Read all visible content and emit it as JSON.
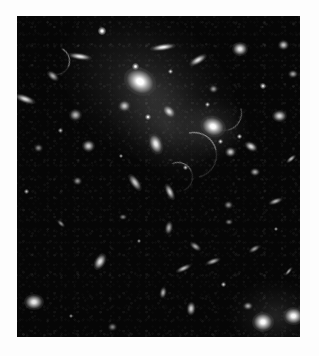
{
  "image": {
    "kind": "astronomical-photograph",
    "subject": "galaxy cluster",
    "description": "Grayscale deep-field image of a rich galaxy cluster with a dominant central cD galaxy, extended intracluster light, numerous elliptical and edge-on member galaxies, foreground stars and faint gravitationally lensed arcs.",
    "color_mode": "grayscale",
    "width_px": 319,
    "height_px": 356,
    "border_color": "#fdfdfd",
    "sky_background_color": "#060606",
    "plate": {
      "x": 17,
      "y": 16,
      "width": 283,
      "height": 321
    }
  },
  "chart_data": {
    "type": "scatter",
    "title": "",
    "xlabel": "",
    "ylabel": "",
    "xlim": [
      0,
      283
    ],
    "ylim": [
      0,
      321
    ],
    "grid": false,
    "legend": "none",
    "series": [
      {
        "name": "intracluster-light",
        "points": [
          {
            "x": 132,
            "y": 72,
            "size": 190,
            "brightness": 0.3,
            "angle": 35,
            "ratio": 0.72
          },
          {
            "x": 150,
            "y": 110,
            "size": 130,
            "brightness": 0.2,
            "angle": 40,
            "ratio": 0.68
          },
          {
            "x": 196,
            "y": 112,
            "size": 72,
            "brightness": 0.26,
            "angle": 10,
            "ratio": 0.85
          },
          {
            "x": 258,
            "y": 300,
            "size": 90,
            "brightness": 0.22,
            "angle": 0,
            "ratio": 0.8
          }
        ]
      },
      {
        "name": "bright-cluster-galaxies",
        "points": [
          {
            "x": 123,
            "y": 66,
            "size": 34,
            "brightness": 1.0,
            "angle": 30,
            "ratio": 0.8,
            "label": "cD-galaxy"
          },
          {
            "x": 196,
            "y": 111,
            "size": 26,
            "brightness": 0.97,
            "angle": 20,
            "ratio": 0.82,
            "label": "second-brightest"
          },
          {
            "x": 139,
            "y": 128,
            "size": 22,
            "brightness": 0.88,
            "angle": 70,
            "ratio": 0.62,
            "label": "elliptical-c"
          },
          {
            "x": 152,
            "y": 96,
            "size": 16,
            "brightness": 0.8,
            "angle": 45,
            "ratio": 0.7
          },
          {
            "x": 107,
            "y": 90,
            "size": 13,
            "brightness": 0.72,
            "angle": 0,
            "ratio": 0.9
          }
        ]
      },
      {
        "name": "member-galaxies",
        "points": [
          {
            "x": 63,
            "y": 41,
            "size": 24,
            "brightness": 0.85,
            "angle": 8,
            "ratio": 0.3
          },
          {
            "x": 146,
            "y": 31,
            "size": 26,
            "brightness": 0.9,
            "angle": 172,
            "ratio": 0.26
          },
          {
            "x": 181,
            "y": 44,
            "size": 20,
            "brightness": 0.82,
            "angle": 150,
            "ratio": 0.4
          },
          {
            "x": 223,
            "y": 33,
            "size": 16,
            "brightness": 0.86,
            "angle": 0,
            "ratio": 0.88
          },
          {
            "x": 266,
            "y": 29,
            "size": 11,
            "brightness": 0.7,
            "angle": 0,
            "ratio": 0.9
          },
          {
            "x": 36,
            "y": 60,
            "size": 14,
            "brightness": 0.62,
            "angle": 40,
            "ratio": 0.55
          },
          {
            "x": 8,
            "y": 83,
            "size": 22,
            "brightness": 0.8,
            "angle": 20,
            "ratio": 0.38
          },
          {
            "x": 58,
            "y": 99,
            "size": 13,
            "brightness": 0.66,
            "angle": 0,
            "ratio": 0.85
          },
          {
            "x": 71,
            "y": 130,
            "size": 13,
            "brightness": 0.74,
            "angle": 0,
            "ratio": 0.88
          },
          {
            "x": 262,
            "y": 100,
            "size": 15,
            "brightness": 0.78,
            "angle": 0,
            "ratio": 0.86
          },
          {
            "x": 234,
            "y": 131,
            "size": 14,
            "brightness": 0.8,
            "angle": 30,
            "ratio": 0.66
          },
          {
            "x": 213,
            "y": 136,
            "size": 11,
            "brightness": 0.72,
            "angle": 0,
            "ratio": 0.85
          },
          {
            "x": 118,
            "y": 166,
            "size": 20,
            "brightness": 0.72,
            "angle": 55,
            "ratio": 0.45
          },
          {
            "x": 153,
            "y": 176,
            "size": 18,
            "brightness": 0.74,
            "angle": 65,
            "ratio": 0.42
          },
          {
            "x": 238,
            "y": 156,
            "size": 10,
            "brightness": 0.6,
            "angle": 0,
            "ratio": 0.85
          },
          {
            "x": 274,
            "y": 143,
            "size": 12,
            "brightness": 0.66,
            "angle": 140,
            "ratio": 0.45
          },
          {
            "x": 60,
            "y": 165,
            "size": 9,
            "brightness": 0.52,
            "angle": 0,
            "ratio": 0.8
          },
          {
            "x": 152,
            "y": 212,
            "size": 14,
            "brightness": 0.6,
            "angle": 100,
            "ratio": 0.55
          },
          {
            "x": 178,
            "y": 230,
            "size": 13,
            "brightness": 0.58,
            "angle": 35,
            "ratio": 0.52
          },
          {
            "x": 196,
            "y": 245,
            "size": 16,
            "brightness": 0.62,
            "angle": 160,
            "ratio": 0.4
          },
          {
            "x": 237,
            "y": 233,
            "size": 13,
            "brightness": 0.55,
            "angle": 150,
            "ratio": 0.45
          },
          {
            "x": 211,
            "y": 189,
            "size": 9,
            "brightness": 0.5,
            "angle": 0,
            "ratio": 0.8
          },
          {
            "x": 258,
            "y": 185,
            "size": 15,
            "brightness": 0.64,
            "angle": 160,
            "ratio": 0.42
          },
          {
            "x": 166,
            "y": 252,
            "size": 17,
            "brightness": 0.66,
            "angle": 155,
            "ratio": 0.38
          },
          {
            "x": 83,
            "y": 246,
            "size": 18,
            "brightness": 0.82,
            "angle": 120,
            "ratio": 0.62
          },
          {
            "x": 146,
            "y": 277,
            "size": 12,
            "brightness": 0.62,
            "angle": 100,
            "ratio": 0.6
          },
          {
            "x": 17,
            "y": 286,
            "size": 20,
            "brightness": 0.88,
            "angle": 0,
            "ratio": 0.8
          },
          {
            "x": 174,
            "y": 293,
            "size": 14,
            "brightness": 0.74,
            "angle": 95,
            "ratio": 0.66
          },
          {
            "x": 231,
            "y": 290,
            "size": 10,
            "brightness": 0.6,
            "angle": 0,
            "ratio": 0.85
          },
          {
            "x": 246,
            "y": 306,
            "size": 22,
            "brightness": 0.96,
            "angle": 0,
            "ratio": 0.9
          },
          {
            "x": 276,
            "y": 300,
            "size": 21,
            "brightness": 0.94,
            "angle": 0,
            "ratio": 0.88
          },
          {
            "x": 271,
            "y": 255,
            "size": 11,
            "brightness": 0.58,
            "angle": 130,
            "ratio": 0.4
          },
          {
            "x": 212,
            "y": 206,
            "size": 8,
            "brightness": 0.45,
            "angle": 0,
            "ratio": 0.8
          },
          {
            "x": 106,
            "y": 201,
            "size": 8,
            "brightness": 0.44,
            "angle": 0,
            "ratio": 0.8
          },
          {
            "x": 44,
            "y": 207,
            "size": 10,
            "brightness": 0.5,
            "angle": 45,
            "ratio": 0.5
          },
          {
            "x": 21,
            "y": 132,
            "size": 9,
            "brightness": 0.48,
            "angle": 0,
            "ratio": 0.82
          },
          {
            "x": 95,
            "y": 311,
            "size": 9,
            "brightness": 0.46,
            "angle": 0,
            "ratio": 0.8
          },
          {
            "x": 196,
            "y": 73,
            "size": 9,
            "brightness": 0.55,
            "angle": 0,
            "ratio": 0.85
          },
          {
            "x": 276,
            "y": 58,
            "size": 10,
            "brightness": 0.58,
            "angle": 0,
            "ratio": 0.85
          }
        ]
      },
      {
        "name": "foreground-stars",
        "points": [
          {
            "x": 85,
            "y": 15,
            "size": 8,
            "brightness": 0.95
          },
          {
            "x": 118,
            "y": 50,
            "size": 7,
            "brightness": 0.88
          },
          {
            "x": 153,
            "y": 55,
            "size": 5,
            "brightness": 0.72
          },
          {
            "x": 190,
            "y": 88,
            "size": 5,
            "brightness": 0.7
          },
          {
            "x": 131,
            "y": 101,
            "size": 6,
            "brightness": 0.85
          },
          {
            "x": 246,
            "y": 70,
            "size": 6,
            "brightness": 0.78
          },
          {
            "x": 43,
            "y": 114,
            "size": 5,
            "brightness": 0.62
          },
          {
            "x": 104,
            "y": 140,
            "size": 4,
            "brightness": 0.58
          },
          {
            "x": 168,
            "y": 151,
            "size": 5,
            "brightness": 0.66
          },
          {
            "x": 9,
            "y": 175,
            "size": 5,
            "brightness": 0.6
          },
          {
            "x": 122,
            "y": 225,
            "size": 4,
            "brightness": 0.52
          },
          {
            "x": 206,
            "y": 268,
            "size": 5,
            "brightness": 0.68
          },
          {
            "x": 259,
            "y": 213,
            "size": 4,
            "brightness": 0.54
          },
          {
            "x": 54,
            "y": 300,
            "size": 4,
            "brightness": 0.5
          },
          {
            "x": 222,
            "y": 120,
            "size": 5,
            "brightness": 0.74
          },
          {
            "x": 203,
            "y": 125,
            "size": 5,
            "brightness": 0.76
          }
        ]
      },
      {
        "name": "lensed-arcs",
        "points": [
          {
            "x": 176,
            "y": 138,
            "length": 44,
            "angle": 32,
            "brightness": 0.55,
            "label": "arc-a"
          },
          {
            "x": 160,
            "y": 160,
            "length": 28,
            "angle": 22,
            "brightness": 0.45,
            "label": "arc-b"
          },
          {
            "x": 38,
            "y": 44,
            "length": 26,
            "angle": 72,
            "brightness": 0.5,
            "label": "arc-c"
          },
          {
            "x": 206,
            "y": 96,
            "length": 34,
            "angle": 120,
            "brightness": 0.35,
            "label": "arc-d"
          }
        ]
      }
    ]
  }
}
